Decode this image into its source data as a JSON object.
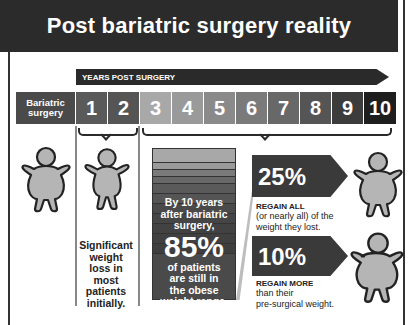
{
  "title": "Post bariatric surgery reality",
  "timeline": {
    "arrow_label": "YEARS POST SURGERY",
    "start_label_line1": "Bariatric",
    "start_label_line2": "surgery",
    "years": [
      {
        "label": "1",
        "color": "#5a5a5a"
      },
      {
        "label": "2",
        "color": "#555555"
      },
      {
        "label": "3",
        "color": "#a8a8a8"
      },
      {
        "label": "4",
        "color": "#9a9a9a"
      },
      {
        "label": "5",
        "color": "#8a8a8a"
      },
      {
        "label": "6",
        "color": "#7a7a7a"
      },
      {
        "label": "7",
        "color": "#686868"
      },
      {
        "label": "8",
        "color": "#555555"
      },
      {
        "label": "9",
        "color": "#3c3c3c"
      },
      {
        "label": "10",
        "color": "#1e1e1e"
      }
    ]
  },
  "early_caption": "Significant weight loss in most patients initially.",
  "stack": {
    "line1": "By 10 years",
    "line2": "after bariatric",
    "line3": "surgery,",
    "percent": "85%",
    "line4": "of patients",
    "line5": "are still in",
    "line6": "the obese",
    "line7": "weight range."
  },
  "stats": [
    {
      "percent": "25%",
      "heading": "REGAIN ALL",
      "body_line1": "(or nearly all) of the",
      "body_line2": "weight they lost."
    },
    {
      "percent": "10%",
      "heading": "REGAIN MORE",
      "body_line1": "than their",
      "body_line2": "pre-surgical weight."
    }
  ],
  "icons": [
    "person-figure-icon"
  ]
}
